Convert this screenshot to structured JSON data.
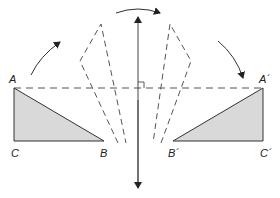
{
  "diagram": {
    "type": "reflection",
    "colors": {
      "stroke": "#333333",
      "fill": "#d9d9d9",
      "dashed": "#555555",
      "axis": "#444444"
    },
    "labels": {
      "A": "A",
      "B": "B",
      "C": "C",
      "A_prime": "A´",
      "B_prime": "B´",
      "C_prime": "C´"
    },
    "original_triangle": {
      "A": [
        14,
        88
      ],
      "B": [
        104,
        141
      ],
      "C": [
        14,
        141
      ]
    },
    "image_triangle": {
      "A_prime": [
        263,
        88
      ],
      "B_prime": [
        173,
        141
      ],
      "C_prime": [
        263,
        141
      ]
    },
    "line_of_reflection": {
      "x": 138,
      "y_top": 15,
      "y_bottom": 188,
      "arrows": "both-ends"
    },
    "right_angle_marker": {
      "at": [
        138,
        88
      ]
    }
  }
}
